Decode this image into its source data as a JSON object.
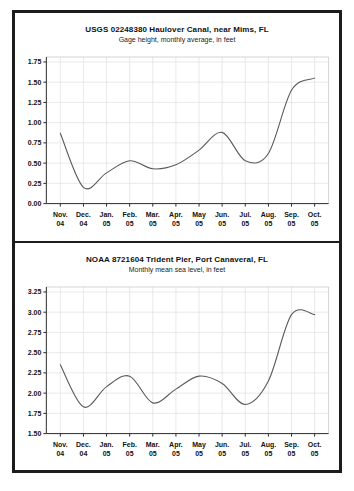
{
  "window": {
    "background": "#ffffff",
    "frame_border_color": "#1c1c1c"
  },
  "chart_data": [
    {
      "type": "line",
      "title": "USGS 02248380 Haulover Canal, near Mims, FL",
      "subtitle": "Gage height, monthly average, in feet",
      "categories": [
        "Nov. 04",
        "Dec. 04",
        "Jan. 05",
        "Feb. 05",
        "Mar. 05",
        "Apr. 05",
        "May 05",
        "Jun. 05",
        "Jul. 05",
        "Aug. 05",
        "Sep. 05",
        "Oct. 05"
      ],
      "categories_month": [
        "Nov.",
        "Dec.",
        "Jan.",
        "Feb.",
        "Mar.",
        "Apr.",
        "May",
        "Jun.",
        "Jul.",
        "Aug.",
        "Sep.",
        "Oct."
      ],
      "categories_year": [
        "04",
        "04",
        "05",
        "05",
        "05",
        "05",
        "05",
        "05",
        "05",
        "05",
        "05",
        "05"
      ],
      "values": [
        0.87,
        0.2,
        0.38,
        0.53,
        0.43,
        0.48,
        0.66,
        0.88,
        0.53,
        0.62,
        1.4,
        1.55
      ],
      "ylim": [
        0.0,
        1.75
      ],
      "ystep": 0.25,
      "y_ticks": [
        "0.00",
        "0.25",
        "0.50",
        "0.75",
        "1.00",
        "1.25",
        "1.50",
        "1.75"
      ],
      "grid": true,
      "legend": "none",
      "line_color": "#5a5a5a",
      "grid_color": "#e0e0e0",
      "axis_color": "#2b2b2b"
    },
    {
      "type": "line",
      "title": "NOAA 8721604 Trident Pier, Port Canaveral, FL",
      "subtitle": "Monthly mean sea level, in feet",
      "categories": [
        "Nov. 04",
        "Dec. 04",
        "Jan. 05",
        "Feb. 05",
        "Mar. 05",
        "Apr. 05",
        "May 05",
        "Jun. 05",
        "Jul. 05",
        "Aug. 05",
        "Sep. 05",
        "Oct. 05"
      ],
      "categories_month": [
        "Nov.",
        "Dec.",
        "Jan.",
        "Feb.",
        "Mar.",
        "Apr.",
        "May",
        "Jun.",
        "Jul.",
        "Aug.",
        "Sep.",
        "Oct."
      ],
      "categories_year": [
        "04",
        "04",
        "05",
        "05",
        "05",
        "05",
        "05",
        "05",
        "05",
        "05",
        "05",
        "05"
      ],
      "values": [
        2.35,
        1.83,
        2.08,
        2.21,
        1.88,
        2.05,
        2.21,
        2.12,
        1.86,
        2.15,
        2.97,
        2.97
      ],
      "ylim": [
        1.5,
        3.25
      ],
      "ystep": 0.25,
      "y_ticks": [
        "1.50",
        "1.75",
        "2.00",
        "2.25",
        "2.50",
        "2.75",
        "3.00",
        "3.25"
      ],
      "grid": true,
      "legend": "none",
      "line_color": "#5a5a5a",
      "grid_color": "#e0e0e0",
      "axis_color": "#2b2b2b"
    }
  ]
}
